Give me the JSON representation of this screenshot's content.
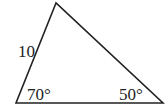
{
  "diagram": {
    "type": "triangle",
    "vertices": {
      "top": [
        56,
        3
      ],
      "bottom_left": [
        16,
        103
      ],
      "bottom_right": [
        163,
        103
      ]
    },
    "side_label": "10",
    "angle_left": "70°",
    "angle_right": "50°",
    "stroke_color": "#222222"
  }
}
